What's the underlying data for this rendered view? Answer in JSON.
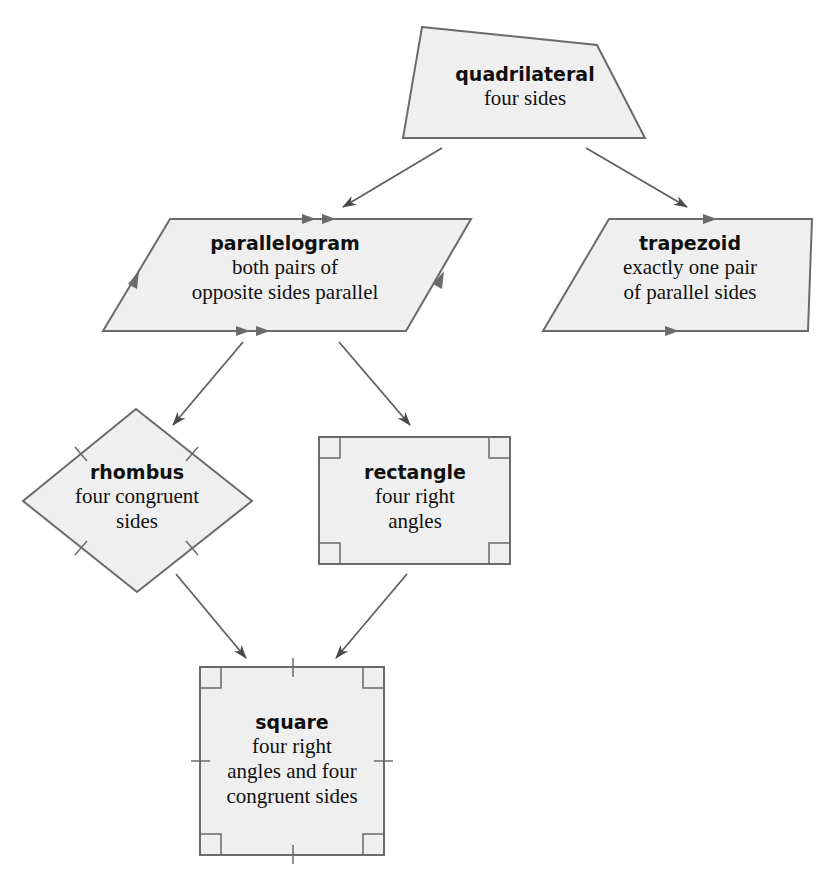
{
  "diagram": {
    "type": "hierarchy",
    "topic": "Classification of quadrilaterals",
    "nodes": {
      "quadrilateral": {
        "title": "quadrilateral",
        "lines": [
          "four sides"
        ]
      },
      "parallelogram": {
        "title": "parallelogram",
        "lines": [
          "both pairs of",
          "opposite sides parallel"
        ]
      },
      "trapezoid": {
        "title": "trapezoid",
        "lines": [
          "exactly one pair",
          "of parallel sides"
        ]
      },
      "rhombus": {
        "title": "rhombus",
        "lines": [
          "four congruent",
          "sides"
        ]
      },
      "rectangle": {
        "title": "rectangle",
        "lines": [
          "four right",
          "angles"
        ]
      },
      "square": {
        "title": "square",
        "lines": [
          "four right",
          "angles and four",
          "congruent sides"
        ]
      }
    },
    "edges": [
      {
        "from": "quadrilateral",
        "to": "parallelogram"
      },
      {
        "from": "quadrilateral",
        "to": "trapezoid"
      },
      {
        "from": "parallelogram",
        "to": "rhombus"
      },
      {
        "from": "parallelogram",
        "to": "rectangle"
      },
      {
        "from": "rhombus",
        "to": "square"
      },
      {
        "from": "rectangle",
        "to": "square"
      }
    ],
    "colors": {
      "fill": "#efefef",
      "stroke": "#6b6b6b",
      "arrow": "#5f5f5f"
    }
  }
}
